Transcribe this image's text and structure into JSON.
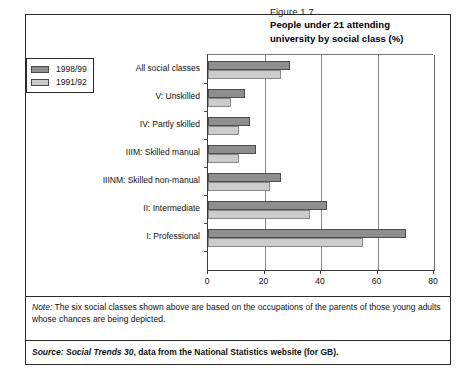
{
  "figure": {
    "number": "Figure 1.7",
    "title_line1": "People under 21 attending",
    "title_line2": "university by social class (%)"
  },
  "legend": {
    "items": [
      {
        "label": "1998/99",
        "color": "#8e8e8e"
      },
      {
        "label": "1991/92",
        "color": "#cccccc"
      }
    ]
  },
  "notes": {
    "note_label": "Note:",
    "note_text": " The six social classes shown above are based on the occupations of the parents of those young adults whose chances are being depicted.",
    "source_label": "Source: Social Trends 30",
    "source_text": ", data from the National Statistics website (for GB)."
  },
  "chart_data": {
    "type": "bar",
    "orientation": "horizontal",
    "title": "People under 21 attending university by social class (%)",
    "xlabel": "",
    "ylabel": "",
    "xlim": [
      0,
      80
    ],
    "xticks": [
      0,
      20,
      40,
      60,
      80
    ],
    "grid": true,
    "legend_position": "left-outside",
    "categories": [
      "All social classes",
      "V: Unskilled",
      "IV: Partly skilled",
      "IIIM: Skilled manual",
      "IIINM: Skilled non-manual",
      "II: Intermediate",
      "I: Professional"
    ],
    "series": [
      {
        "name": "1998/99",
        "color": "#8e8e8e",
        "values": [
          29,
          13,
          15,
          17,
          26,
          42,
          70
        ]
      },
      {
        "name": "1991/92",
        "color": "#cccccc",
        "values": [
          26,
          8,
          11,
          11,
          22,
          36,
          55
        ]
      }
    ]
  }
}
